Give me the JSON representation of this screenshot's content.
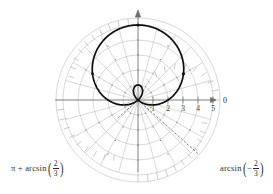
{
  "figure": {
    "type": "polar-plot",
    "title": "",
    "background_color": "#ffffff",
    "curve_color": "#0d0d0d",
    "grid_color": "#a8a8a8",
    "axis_color": "#6e6e6e"
  },
  "axes": {
    "polar_axis_label": "0",
    "radial_tick_labels": [
      "1",
      "2",
      "3",
      "4",
      "5"
    ],
    "radial_tick_values": [
      1,
      2,
      3,
      4,
      5
    ],
    "r_max": 5,
    "angular_divisions": 24,
    "grid_on": true
  },
  "annotations": {
    "left": {
      "lead": "π + arcsin",
      "open_paren": "(",
      "numerator": "2",
      "denominator": "3",
      "sign": "",
      "close_paren": ")",
      "full_text": "π + arcsin(2/3)"
    },
    "right": {
      "lead": "arcsin",
      "open_paren": "(",
      "numerator": "2",
      "denominator": "3",
      "sign": "−",
      "close_paren": ")",
      "full_text": "arcsin(−2/3)"
    }
  },
  "chart_data": {
    "type": "line",
    "coordinate_system": "polar",
    "title": "",
    "xlabel": "",
    "ylabel": "",
    "equation": "r = 2 + 3 sin(θ)",
    "theta_units": "radians",
    "r_range": [
      -1,
      5
    ],
    "rlim": [
      0,
      5
    ],
    "radial_ticks": [
      1,
      2,
      3,
      4,
      5
    ],
    "angular_tick_count": 24,
    "legend_position": "none",
    "annotation_angles_deg": [
      -41.81,
      221.81
    ],
    "marked_points": [
      {
        "theta_deg": 90,
        "r": 5,
        "label": ""
      },
      {
        "theta_deg": 30,
        "r": 3.5,
        "label": ""
      },
      {
        "theta_deg": 150,
        "r": 3.5,
        "label": ""
      },
      {
        "theta_deg": -41.81,
        "r": 0,
        "label": ""
      }
    ],
    "series": [
      {
        "name": "r = 2 + 3 sin(θ)",
        "color": "#0d0d0d",
        "points_theta_deg": [
          0,
          15,
          30,
          45,
          60,
          75,
          90,
          105,
          120,
          135,
          150,
          165,
          180,
          195,
          210,
          218,
          221.81,
          230,
          240,
          255,
          270,
          285,
          300,
          310,
          318.19,
          322,
          330,
          345,
          360
        ],
        "points_r": [
          2,
          2.78,
          3.5,
          4.12,
          4.6,
          4.9,
          5,
          4.9,
          4.6,
          4.12,
          3.5,
          2.78,
          2,
          1.22,
          0.5,
          0.15,
          0,
          -0.3,
          -0.6,
          -0.9,
          -1,
          -0.9,
          -0.6,
          -0.3,
          0,
          0.15,
          0.5,
          1.22,
          2
        ]
      }
    ]
  }
}
